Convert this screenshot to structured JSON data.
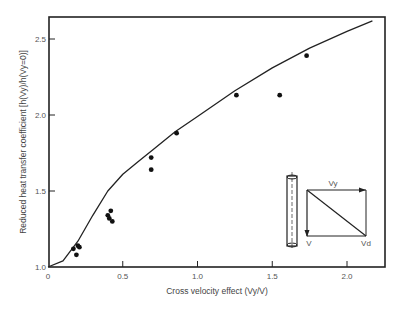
{
  "chart_data": {
    "type": "scatter",
    "title": "",
    "xlabel": "Cross velocity effect (Vy/V)",
    "ylabel": "Reduced heat transfer coefficient [h(Vy)/h(Vy=0)]",
    "xlim": [
      0,
      2.25
    ],
    "ylim": [
      1.0,
      2.65
    ],
    "xticks": [
      "0",
      "0.5",
      "1.0",
      "1.5",
      "2.0"
    ],
    "yticks": [
      "1.0",
      "1.5",
      "2.0",
      "2.5"
    ],
    "grid": false,
    "legend": null,
    "series": [
      {
        "name": "Theory (curve)",
        "kind": "line",
        "x": [
          0,
          0.1,
          0.2,
          0.3,
          0.4,
          0.5,
          0.6,
          0.7,
          0.85,
          1.0,
          1.25,
          1.5,
          1.75,
          2.0,
          2.17
        ],
        "y": [
          1.0,
          1.04,
          1.17,
          1.34,
          1.5,
          1.61,
          1.69,
          1.77,
          1.89,
          1.99,
          2.16,
          2.31,
          2.44,
          2.55,
          2.62
        ]
      },
      {
        "name": "Experimental data",
        "kind": "scatter",
        "x": [
          0.17,
          0.2,
          0.21,
          0.19,
          0.4,
          0.41,
          0.43,
          0.42,
          0.69,
          0.69,
          0.86,
          1.26,
          1.55,
          1.73
        ],
        "y": [
          1.12,
          1.14,
          1.13,
          1.08,
          1.34,
          1.32,
          1.3,
          1.37,
          1.72,
          1.64,
          1.88,
          2.13,
          2.13,
          2.39
        ]
      }
    ],
    "annotations": {
      "inset_diagram": "vertical cylinder with velocity vector triangle",
      "vector_labels": [
        "Vy",
        "V",
        "Vd"
      ]
    }
  }
}
